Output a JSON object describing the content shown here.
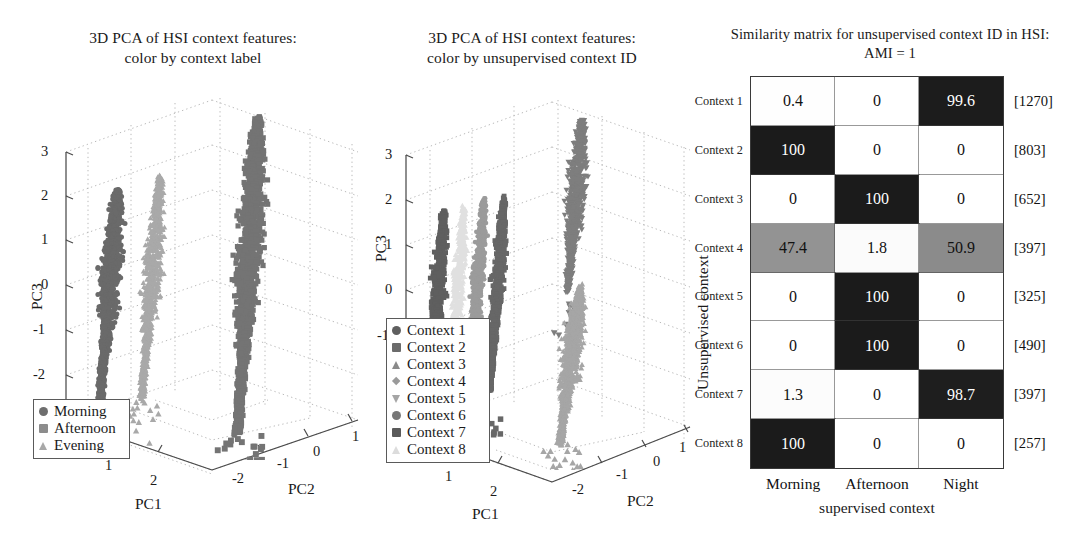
{
  "figure": {
    "background": "#ffffff",
    "width": 1092,
    "height": 555
  },
  "panels": [
    {
      "id": "pca-context-label",
      "title_line1": "3D PCA of HSI context features:",
      "title_line2": "color by context label"
    },
    {
      "id": "pca-unsupervised-id",
      "title_line1": "3D PCA of HSI context features:",
      "title_line2": "color by unsupervised context ID"
    },
    {
      "id": "similarity-matrix",
      "title_line1": "Similarity matrix for unsupervised context ID in HSI:",
      "title_line2": "AMI = 1"
    }
  ],
  "pca_label_plot": {
    "xlabel": "PC1",
    "ylabel": "PC2",
    "zlabel": "PC3",
    "x_ticks": [
      "1",
      "2"
    ],
    "y_ticks": [
      "-2",
      "-1",
      "0",
      "1"
    ],
    "z_ticks": [
      "3",
      "2",
      "1",
      "0",
      "-1",
      "-2",
      "-3"
    ],
    "legend": [
      {
        "label": "Morning",
        "marker": "circle",
        "color": "#6e6e6e"
      },
      {
        "label": "Afternoon",
        "marker": "square",
        "color": "#8c8c8c"
      },
      {
        "label": "Evening",
        "marker": "triangle-up",
        "color": "#a8a8a8"
      }
    ]
  },
  "pca_cluster_plot": {
    "xlabel": "PC1",
    "ylabel": "PC2",
    "zlabel": "PC3",
    "x_ticks": [
      "1",
      "2"
    ],
    "y_ticks": [
      "-2",
      "-1",
      "0",
      "1"
    ],
    "z_ticks": [
      "3",
      "2",
      "1",
      "0",
      "-1"
    ],
    "legend": [
      {
        "label": "Context 1",
        "marker": "circle",
        "color": "#5f5f5f"
      },
      {
        "label": "Context 2",
        "marker": "square",
        "color": "#6b6b6b"
      },
      {
        "label": "Context 3",
        "marker": "triangle-up",
        "color": "#8a8a8a"
      },
      {
        "label": "Context 4",
        "marker": "diamond",
        "color": "#9a9a9a"
      },
      {
        "label": "Context 5",
        "marker": "triangle-down",
        "color": "#a5a5a5"
      },
      {
        "label": "Context 6",
        "marker": "circle",
        "color": "#777777"
      },
      {
        "label": "Context 7",
        "marker": "square",
        "color": "#5a5a5a"
      },
      {
        "label": "Context 8",
        "marker": "triangle-up",
        "color": "#dcdcdc"
      }
    ]
  },
  "chart_data": {
    "type": "heatmap",
    "title": "Similarity matrix for unsupervised context ID in HSI: AMI = 1",
    "xlabel": "supervised context",
    "ylabel": "Unsupervised context",
    "columns": [
      "Morning",
      "Afternoon",
      "Night"
    ],
    "rows": [
      "Context 1",
      "Context 2",
      "Context 3",
      "Context 4",
      "Context 5",
      "Context 6",
      "Context 7",
      "Context 8"
    ],
    "row_counts": [
      "[1270]",
      "[803]",
      "[652]",
      "[397]",
      "[325]",
      "[490]",
      "[397]",
      "[257]"
    ],
    "values": [
      [
        0.4,
        0,
        99.6
      ],
      [
        100,
        0,
        0
      ],
      [
        0,
        100,
        0
      ],
      [
        47.4,
        1.8,
        50.9
      ],
      [
        0,
        100,
        0
      ],
      [
        0,
        100,
        0
      ],
      [
        1.3,
        0,
        98.7
      ],
      [
        100,
        0,
        0
      ]
    ],
    "display_values": [
      [
        "0.4",
        "0",
        "99.6"
      ],
      [
        "100",
        "0",
        "0"
      ],
      [
        "0",
        "100",
        "0"
      ],
      [
        "47.4",
        "1.8",
        "50.9"
      ],
      [
        "0",
        "100",
        "0"
      ],
      [
        "0",
        "100",
        "0"
      ],
      [
        "1.3",
        "0",
        "98.7"
      ],
      [
        "100",
        "0",
        "0"
      ]
    ],
    "colormap": "grayscale-inverted",
    "vmin": 0,
    "vmax": 100,
    "grid": true,
    "legend_position": "none"
  }
}
